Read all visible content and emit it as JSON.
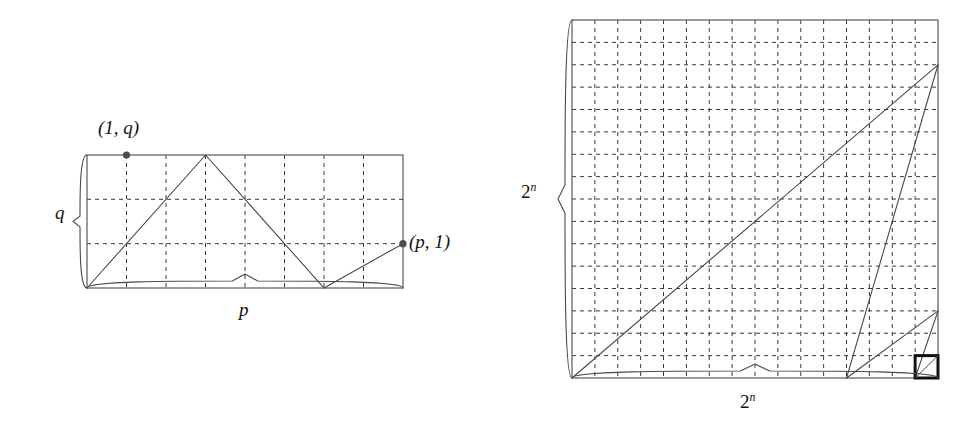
{
  "figure": {
    "background_color": "#ffffff",
    "ink_color": "#3a3a3a",
    "solid_color": "#4a4a4a",
    "bold_color": "#111111",
    "dash_pattern": "4,4"
  },
  "left_panel": {
    "name": "p-by-q lattice rectangle",
    "rect": {
      "x": 87,
      "y": 155,
      "width": 316,
      "height": 133
    },
    "grid": {
      "columns": 8,
      "rows": 3,
      "style": "dashed"
    },
    "labels": {
      "point_top": "(1, q)",
      "point_right": "(p, 1)",
      "brace_left": "q",
      "brace_bottom": "p"
    },
    "markers": [
      {
        "name": "point-1-q",
        "col": 1,
        "row": 3,
        "label": "(1, q)"
      },
      {
        "name": "point-p-1",
        "col": 8,
        "row": 1,
        "label": "(p, 1)"
      }
    ],
    "path_vertices": [
      {
        "col": 0,
        "row": 0
      },
      {
        "col": 3,
        "row": 3
      },
      {
        "col": 6,
        "row": 0
      },
      {
        "col": 8,
        "row": 1
      }
    ],
    "braces": {
      "left": {
        "covers": "q",
        "side": "left"
      },
      "bottom": {
        "covers": "p",
        "side": "bottom"
      }
    }
  },
  "right_panel": {
    "name": "2^n by 2^n recursive square",
    "rect": {
      "x": 572,
      "y": 20,
      "width": 366,
      "height": 358
    },
    "grid": {
      "columns": 16,
      "rows": 16,
      "style": "dashed"
    },
    "labels": {
      "brace_left_base": "2",
      "brace_left_exp": "n",
      "brace_bottom_base": "2",
      "brace_bottom_exp": "n"
    },
    "path_vertices": [
      {
        "col": 0,
        "row": 0
      },
      {
        "col": 16,
        "row": 14
      },
      {
        "col": 12,
        "row": 0
      },
      {
        "col": 16,
        "row": 3
      },
      {
        "col": 15,
        "row": 0
      }
    ],
    "highlight_square": {
      "name": "recursive-base-cell",
      "col": 15,
      "row": 0,
      "size_cells": 1,
      "stroke": "#111111",
      "stroke_width": 3,
      "has_diagonal": true
    },
    "braces": {
      "left": {
        "covers": "2^n",
        "side": "left"
      },
      "bottom": {
        "covers": "2^n",
        "side": "bottom"
      }
    }
  }
}
